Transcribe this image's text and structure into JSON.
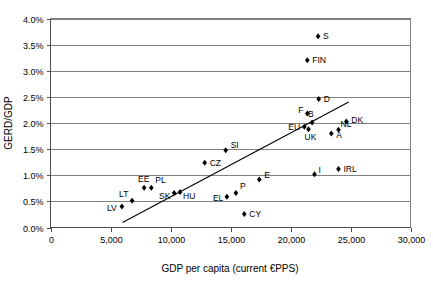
{
  "chart_data": {
    "type": "scatter",
    "title": "",
    "xlabel": "GDP per capita (current €PPS)",
    "ylabel": "GERD/GDP",
    "xlim": [
      0,
      30000
    ],
    "ylim": [
      0,
      4.0
    ],
    "grid": true,
    "gridlines": "horizontal",
    "legend": "none",
    "xtick_labels": [
      "0",
      "5,000",
      "10,000",
      "15,000",
      "20,000",
      "25,000",
      "30,000"
    ],
    "xtick_values": [
      0,
      5000,
      10000,
      15000,
      20000,
      25000,
      30000
    ],
    "ytick_labels": [
      "0.0%",
      "0.5%",
      "1.0%",
      "1.5%",
      "2.0%",
      "2.5%",
      "3.0%",
      "3.5%",
      "4.0%"
    ],
    "ytick_values": [
      0.0,
      0.5,
      1.0,
      1.5,
      2.0,
      2.5,
      3.0,
      3.5,
      4.0
    ],
    "marker_color": "#000000",
    "marker_shape": "diamond",
    "trendline": {
      "show": true,
      "color": "#000000",
      "x_start": 6000,
      "y_start": 0.095,
      "x_end": 24850,
      "y_end": 2.4
    },
    "points": [
      {
        "label": "LV",
        "x": 5950,
        "y": 0.4,
        "label_dx": -15,
        "label_dy": 4
      },
      {
        "label": "LT",
        "x": 6800,
        "y": 0.51,
        "label_dx": -13,
        "label_dy": -4
      },
      {
        "label": "EE",
        "x": 7800,
        "y": 0.76,
        "label_dx": -6,
        "label_dy": -6
      },
      {
        "label": "PL",
        "x": 8400,
        "y": 0.76,
        "label_dx": 4,
        "label_dy": -5
      },
      {
        "label": "SK",
        "x": 10300,
        "y": 0.66,
        "label_dx": -15,
        "label_dy": 6
      },
      {
        "label": "HU",
        "x": 10800,
        "y": 0.68,
        "label_dx": 3,
        "label_dy": 7
      },
      {
        "label": "CZ",
        "x": 12850,
        "y": 1.24,
        "label_dx": 5,
        "label_dy": 3
      },
      {
        "label": "SI",
        "x": 14600,
        "y": 1.48,
        "label_dx": 5,
        "label_dy": -2
      },
      {
        "label": "EL",
        "x": 14700,
        "y": 0.59,
        "label_dx": -14,
        "label_dy": 4
      },
      {
        "label": "P",
        "x": 15450,
        "y": 0.66,
        "label_dx": 4,
        "label_dy": -4
      },
      {
        "label": "CY",
        "x": 16150,
        "y": 0.26,
        "label_dx": 5,
        "label_dy": 3
      },
      {
        "label": "E",
        "x": 17400,
        "y": 0.92,
        "label_dx": 5,
        "label_dy": -1
      },
      {
        "label": "I",
        "x": 22000,
        "y": 1.02,
        "label_dx": 4,
        "label_dy": -1
      },
      {
        "label": "IRL",
        "x": 24000,
        "y": 1.12,
        "label_dx": 5,
        "label_dy": 3
      },
      {
        "label": "EU",
        "x": 21150,
        "y": 1.93,
        "label_dx": -16,
        "label_dy": 3
      },
      {
        "label": "UK",
        "x": 21500,
        "y": 1.88,
        "label_dx": -4,
        "label_dy": 11
      },
      {
        "label": "B",
        "x": 21800,
        "y": 2.01,
        "label_dx": -4,
        "label_dy": -5
      },
      {
        "label": "F",
        "x": 21400,
        "y": 2.18,
        "label_dx": -9,
        "label_dy": -1
      },
      {
        "label": "D",
        "x": 22350,
        "y": 2.46,
        "label_dx": 5,
        "label_dy": 3
      },
      {
        "label": "A",
        "x": 23400,
        "y": 1.8,
        "label_dx": 5,
        "label_dy": 5
      },
      {
        "label": "NL",
        "x": 24000,
        "y": 1.87,
        "label_dx": 2,
        "label_dy": -3
      },
      {
        "label": "DK",
        "x": 24650,
        "y": 2.03,
        "label_dx": 5,
        "label_dy": 2
      },
      {
        "label": "FIN",
        "x": 21400,
        "y": 3.2,
        "label_dx": 5,
        "label_dy": 3
      },
      {
        "label": "S",
        "x": 22300,
        "y": 3.66,
        "label_dx": 5,
        "label_dy": 3
      }
    ]
  }
}
